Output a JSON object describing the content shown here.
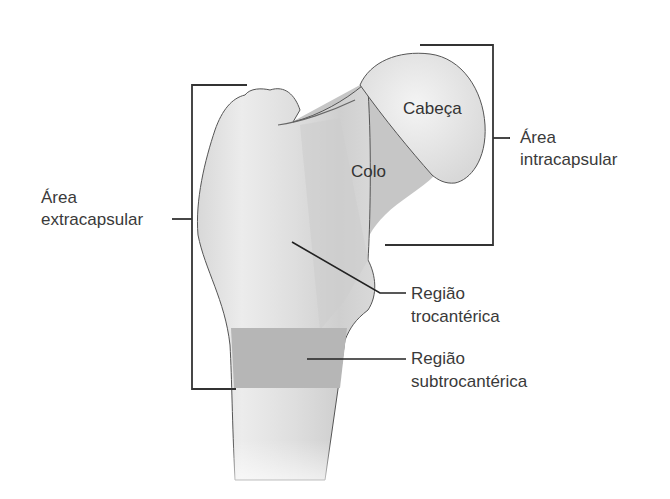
{
  "diagram": {
    "labels": {
      "head": "Cabeça",
      "neck": "Colo",
      "intracapsular_line1": "Área",
      "intracapsular_line2": "intracapsular",
      "extracapsular_line1": "Área",
      "extracapsular_line2": "extracapsular",
      "trochanteric_line1": "Região",
      "trochanteric_line2": "trocantérica",
      "subtrochanteric_line1": "Região",
      "subtrochanteric_line2": "subtrocantérica"
    },
    "colors": {
      "bone_light": "#e6e6e6",
      "bone_mid": "#d2d2d2",
      "neck": "#c4c4c4",
      "subtrochanteric_band": "#b4b4b4",
      "head": "#ebebeb",
      "outline": "#555555",
      "line": "#333333"
    }
  }
}
